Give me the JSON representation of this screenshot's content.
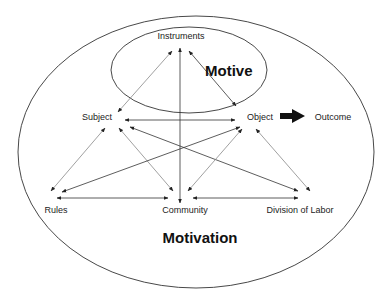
{
  "diagram": {
    "outer_region_label": "Motivation",
    "inner_region_label": "Motive",
    "nodes": {
      "instruments": "Instruments",
      "subject": "Subject",
      "object": "Object",
      "outcome": "Outcome",
      "rules": "Rules",
      "community": "Community",
      "division_of_labor": "Division of Labor"
    },
    "edges": [
      {
        "from": "Subject",
        "to": "Instruments",
        "type": "bidirectional"
      },
      {
        "from": "Object",
        "to": "Instruments",
        "type": "bidirectional"
      },
      {
        "from": "Community",
        "to": "Instruments",
        "type": "bidirectional"
      },
      {
        "from": "Subject",
        "to": "Object",
        "type": "bidirectional"
      },
      {
        "from": "Subject",
        "to": "Rules",
        "type": "bidirectional"
      },
      {
        "from": "Subject",
        "to": "Community",
        "type": "bidirectional"
      },
      {
        "from": "Subject",
        "to": "Division of Labor",
        "type": "bidirectional"
      },
      {
        "from": "Object",
        "to": "Rules",
        "type": "bidirectional"
      },
      {
        "from": "Object",
        "to": "Community",
        "type": "bidirectional"
      },
      {
        "from": "Object",
        "to": "Division of Labor",
        "type": "bidirectional"
      },
      {
        "from": "Rules",
        "to": "Community",
        "type": "bidirectional"
      },
      {
        "from": "Community",
        "to": "Division of Labor",
        "type": "bidirectional"
      },
      {
        "from": "Object",
        "to": "Outcome",
        "type": "bold-arrow"
      }
    ]
  }
}
